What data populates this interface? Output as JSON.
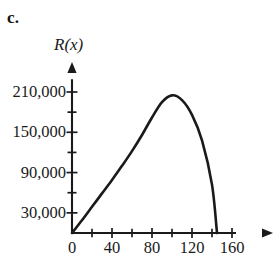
{
  "figure": {
    "part_label": "c.",
    "y_axis_title": "R(x)"
  },
  "chart_data": {
    "type": "line",
    "title": "",
    "subtitle": "",
    "xlabel": "",
    "ylabel": "R(x)",
    "xlim": [
      0,
      168
    ],
    "ylim": [
      0,
      232000
    ],
    "grid": false,
    "legend": "none",
    "x_major_ticks": [
      0,
      40,
      80,
      120,
      160
    ],
    "x_major_tick_labels": [
      "0",
      "40",
      "80",
      "120",
      "160"
    ],
    "x_minor_ticks": [
      20,
      60,
      100,
      140
    ],
    "y_major_ticks": [
      30000,
      90000,
      150000,
      210000
    ],
    "y_major_tick_labels": [
      "30,000",
      "90,000",
      "150,000",
      "210,000"
    ],
    "y_minor_ticks": [
      60000,
      120000,
      180000
    ],
    "series": [
      {
        "name": "R(x)",
        "color": "#1a1a1a",
        "x": [
          0,
          10,
          20,
          30,
          40,
          50,
          60,
          70,
          80,
          90,
          100,
          110,
          120,
          130,
          140,
          145
        ],
        "y": [
          0,
          19000,
          39000,
          59000,
          79000,
          100000,
          122000,
          146000,
          172000,
          195000,
          205000,
          198000,
          176000,
          138000,
          72000,
          0
        ]
      }
    ],
    "annotations": [
      {
        "text": "peak",
        "x": 100,
        "y": 205000
      },
      {
        "text": "x-intercept",
        "x": 145,
        "y": 0
      }
    ]
  }
}
